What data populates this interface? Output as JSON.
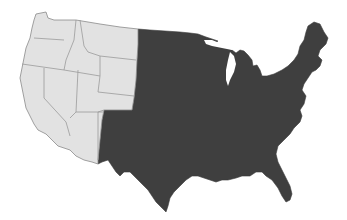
{
  "map": {
    "subject": "Contiguous United States",
    "colors": {
      "background": "#ffffff",
      "highlighted_region": "#e2e2e2",
      "other_region": "#3f3f3f",
      "state_borders_light": "#8a8a8a"
    },
    "regions": [
      {
        "name": "Western states",
        "shade": "light gray",
        "states": [
          "Washington",
          "Oregon",
          "California",
          "Idaho",
          "Nevada",
          "Montana",
          "Wyoming",
          "Utah",
          "Colorado",
          "Arizona",
          "New Mexico (partial, west of shading boundary)"
        ]
      },
      {
        "name": "Remaining states",
        "shade": "dark gray",
        "states": [
          "North Dakota",
          "South Dakota",
          "Nebraska",
          "Kansas",
          "Oklahoma",
          "Texas",
          "Minnesota",
          "Iowa",
          "Missouri",
          "Arkansas",
          "Louisiana",
          "Wisconsin",
          "Illinois",
          "Michigan",
          "Indiana",
          "Ohio",
          "Kentucky",
          "Tennessee",
          "Mississippi",
          "Alabama",
          "Georgia",
          "Florida",
          "South Carolina",
          "North Carolina",
          "Virginia",
          "West Virginia",
          "Maryland",
          "Delaware",
          "Pennsylvania",
          "New Jersey",
          "New York",
          "Connecticut",
          "Rhode Island",
          "Massachusetts",
          "Vermont",
          "New Hampshire",
          "Maine"
        ]
      }
    ]
  }
}
